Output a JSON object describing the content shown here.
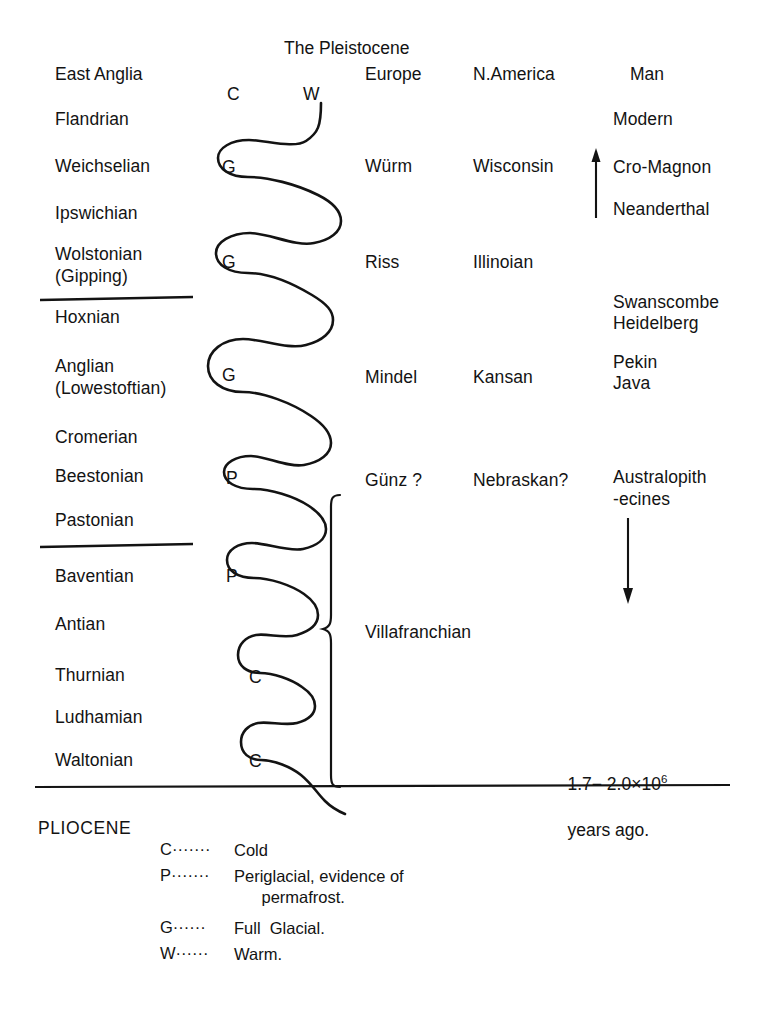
{
  "title": "The Pleistocene",
  "columns": {
    "east_anglia": "East Anglia",
    "curve_cold": "C",
    "curve_warm": "W",
    "europe": "Europe",
    "namerica": "N.America",
    "man": "Man"
  },
  "east_anglia_stages": [
    {
      "label": "Flandrian",
      "y": 109
    },
    {
      "label": "Weichselian",
      "y": 156
    },
    {
      "label": "Ipswichian",
      "y": 203
    },
    {
      "label": "Wolstonian\n(Gipping)",
      "y": 243
    },
    {
      "label": "Hoxnian",
      "y": 307
    },
    {
      "label": "Anglian\n(Lowestoftian)",
      "y": 355
    },
    {
      "label": "Cromerian",
      "y": 427
    },
    {
      "label": "Beestonian",
      "y": 466
    },
    {
      "label": "Pastonian",
      "y": 510
    },
    {
      "label": "Baventian",
      "y": 566
    },
    {
      "label": "Antian",
      "y": 614
    },
    {
      "label": "Thurnian",
      "y": 665
    },
    {
      "label": "Ludhamian",
      "y": 707
    },
    {
      "label": "Waltonian",
      "y": 750
    }
  ],
  "curve_markers": [
    {
      "label": "G",
      "y": 157,
      "x": 222
    },
    {
      "label": "G",
      "y": 252,
      "x": 222
    },
    {
      "label": "G",
      "y": 365,
      "x": 222
    },
    {
      "label": "P",
      "y": 468,
      "x": 226
    },
    {
      "label": "P",
      "y": 566,
      "x": 226
    },
    {
      "label": "C",
      "y": 667,
      "x": 249
    },
    {
      "label": "C",
      "y": 751,
      "x": 249
    }
  ],
  "europe_stages": [
    {
      "label": "Würm",
      "y": 156
    },
    {
      "label": "Riss",
      "y": 252
    },
    {
      "label": "Mindel",
      "y": 367
    },
    {
      "label": "Günz ?",
      "y": 470
    }
  ],
  "namerica_stages": [
    {
      "label": "Wisconsin",
      "y": 156
    },
    {
      "label": "Illinoian",
      "y": 252
    },
    {
      "label": "Kansan",
      "y": 367
    },
    {
      "label": "Nebraskan?",
      "y": 470
    }
  ],
  "man_entries": [
    {
      "label": "Modern",
      "y": 109
    },
    {
      "label": "Cro-Magnon",
      "y": 157
    },
    {
      "label": "Neanderthal",
      "y": 199
    },
    {
      "label": "Swanscombe",
      "y": 292
    },
    {
      "label": "Heidelberg",
      "y": 313
    },
    {
      "label": "Pekin",
      "y": 352
    },
    {
      "label": "Java",
      "y": 373
    },
    {
      "label": "Australopith\n-ecines",
      "y": 466
    }
  ],
  "bracket_label": "Villafranchian",
  "pliocene": "PLIOCENE",
  "age_note": "1.7− 2.0×10",
  "age_exponent": "6",
  "age_note2": "years ago.",
  "legend": [
    {
      "key": "C",
      "dots": "·······",
      "text": "Cold"
    },
    {
      "key": "P",
      "dots": "·······",
      "text": "Periglacial, evidence of\n      permafrost."
    },
    {
      "key": "G",
      "dots": "······",
      "text": "Full  Glacial."
    },
    {
      "key": "W",
      "dots": "······",
      "text": "Warm."
    }
  ],
  "colors": {
    "ink": "#131313",
    "background": "#ffffff"
  }
}
